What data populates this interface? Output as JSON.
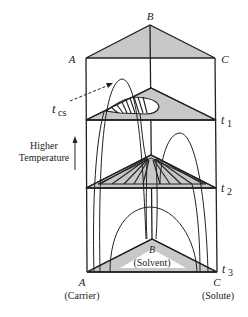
{
  "diagram": {
    "vertices": {
      "A": "A",
      "B": "B",
      "C": "C"
    },
    "vertex_roles": {
      "A": "(Carrier)",
      "B": "(Solvent)",
      "C": "(Solute)"
    },
    "temperature_levels": [
      {
        "symbol": "t",
        "subscript": "1"
      },
      {
        "symbol": "t",
        "subscript": "2"
      },
      {
        "symbol": "t",
        "subscript": "3"
      }
    ],
    "critical_solution": {
      "symbol": "t",
      "subscript": "cs"
    },
    "axis_label_line1": "Higher",
    "axis_label_line2": "Temperature",
    "colors": {
      "line": "#222222",
      "shading": "#c8c8c8",
      "background": "#ffffff"
    }
  }
}
